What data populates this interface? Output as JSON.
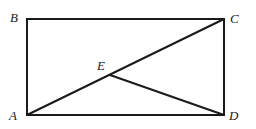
{
  "diagram": {
    "type": "geometry",
    "points": {
      "A": {
        "label": "A",
        "x": 27,
        "y": 115
      },
      "B": {
        "label": "B",
        "x": 27,
        "y": 19
      },
      "C": {
        "label": "C",
        "x": 224,
        "y": 19
      },
      "D": {
        "label": "D",
        "x": 224,
        "y": 115
      },
      "E": {
        "label": "E",
        "x": 110,
        "y": 75
      }
    },
    "segments": [
      "AB",
      "BC",
      "CD",
      "DA",
      "AC",
      "ED"
    ]
  }
}
